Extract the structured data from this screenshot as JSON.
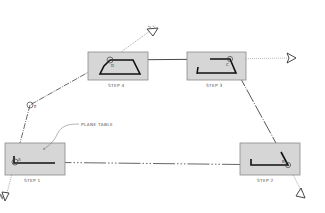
{
  "diagram": {
    "steps": [
      {
        "id": "step1",
        "label": "STEP 1",
        "station": "A",
        "box": {
          "x": 5,
          "y": 143,
          "w": 60,
          "h": 32
        },
        "point": {
          "x": 15,
          "y": 162
        }
      },
      {
        "id": "step2",
        "label": "STEP 2",
        "station": "B",
        "box": {
          "x": 240,
          "y": 143,
          "w": 60,
          "h": 32
        },
        "point": {
          "x": 288,
          "y": 165
        }
      },
      {
        "id": "step3",
        "label": "STEP 3",
        "station": "C",
        "box": {
          "x": 187,
          "y": 52,
          "w": 59,
          "h": 28
        },
        "point": {
          "x": 230,
          "y": 59
        }
      },
      {
        "id": "step4",
        "label": "STEP 4",
        "station": "D",
        "box": {
          "x": 88,
          "y": 52,
          "w": 60,
          "h": 28
        },
        "point": {
          "x": 110,
          "y": 60
        }
      }
    ],
    "extra_station": {
      "label": "E",
      "x": 30,
      "y": 105
    },
    "annotation": {
      "text": "PLANE TABLE"
    },
    "colors": {
      "table_fill": "#d6d6d6",
      "table_border": "#8a8a8a",
      "line": "#333333",
      "plot": "#111111",
      "text": "#555555"
    }
  }
}
